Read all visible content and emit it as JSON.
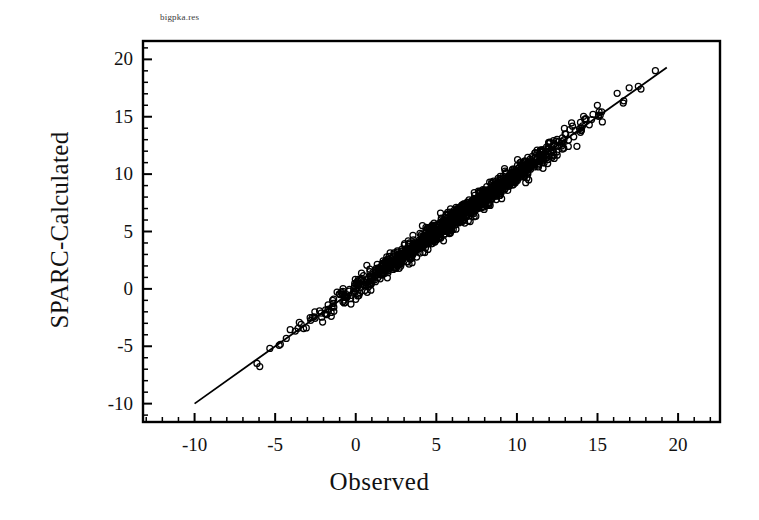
{
  "figure": {
    "file_label": "bigpka.res",
    "background_color": "#ffffff",
    "foreground_color": "#000000"
  },
  "chart_data": {
    "type": "scatter",
    "title": "",
    "subtitle": "",
    "xlabel": "Observed",
    "ylabel": "SPARC-Calculated",
    "xlim": [
      -13.2,
      22.6
    ],
    "ylim": [
      -11.6,
      21.6
    ],
    "xticks": [
      -10,
      -5,
      0,
      5,
      10,
      15,
      20
    ],
    "yticks": [
      -10,
      -5,
      0,
      5,
      10,
      15,
      20
    ],
    "xtick_labels": [
      "-10",
      "-5",
      "0",
      "5",
      "10",
      "15",
      "20"
    ],
    "ytick_labels": [
      "-10",
      "-5",
      "0",
      "5",
      "10",
      "15",
      "20"
    ],
    "minor_tick_interval": 1,
    "grid": false,
    "legend": null,
    "legend_position": "none",
    "marker": "open-circle",
    "marker_size_px": 6,
    "marker_edge_color": "#000000",
    "marker_face_color": "none",
    "fit_line": {
      "label": "",
      "color": "#000000",
      "slope": 1.0,
      "intercept": 0.0,
      "x_start": -10.0,
      "y_start": -10.0,
      "x_end": 19.3,
      "y_end": 19.3
    },
    "n_points": 1200,
    "point_cloud_description": "Dense band of open circles along the 1:1 identity line from about (-8,-8) to (19,19); density peaks between 2 and 11 where markers overlap into a solid black band.",
    "series": [
      {
        "name": "pKa data",
        "x_range": [
          -8.4,
          19.3
        ],
        "y_range": [
          -8.0,
          19.2
        ],
        "scatter_sd": 0.45,
        "density_profile": [
          {
            "x": -8.5,
            "weight": 1
          },
          {
            "x": -7.0,
            "weight": 1
          },
          {
            "x": -6.0,
            "weight": 2
          },
          {
            "x": -5.0,
            "weight": 3
          },
          {
            "x": -4.0,
            "weight": 5
          },
          {
            "x": -3.0,
            "weight": 8
          },
          {
            "x": -2.0,
            "weight": 14
          },
          {
            "x": -1.0,
            "weight": 22
          },
          {
            "x": 0.0,
            "weight": 34
          },
          {
            "x": 1.0,
            "weight": 48
          },
          {
            "x": 2.0,
            "weight": 62
          },
          {
            "x": 3.0,
            "weight": 76
          },
          {
            "x": 4.0,
            "weight": 88
          },
          {
            "x": 5.0,
            "weight": 96
          },
          {
            "x": 6.0,
            "weight": 100
          },
          {
            "x": 7.0,
            "weight": 97
          },
          {
            "x": 8.0,
            "weight": 90
          },
          {
            "x": 9.0,
            "weight": 78
          },
          {
            "x": 10.0,
            "weight": 62
          },
          {
            "x": 11.0,
            "weight": 42
          },
          {
            "x": 12.0,
            "weight": 24
          },
          {
            "x": 13.0,
            "weight": 12
          },
          {
            "x": 14.0,
            "weight": 7
          },
          {
            "x": 15.0,
            "weight": 5
          },
          {
            "x": 16.0,
            "weight": 3
          },
          {
            "x": 17.0,
            "weight": 2
          },
          {
            "x": 18.0,
            "weight": 1
          },
          {
            "x": 19.3,
            "weight": 1
          }
        ]
      }
    ]
  },
  "axes_geometry": {
    "left_px": 143,
    "right_px": 720,
    "top_px": 41,
    "bottom_px": 422
  }
}
